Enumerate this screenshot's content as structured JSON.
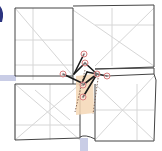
{
  "diagram": {
    "type": "origami-fold-diagram",
    "colors": {
      "background": "#ffffff",
      "outline": "#444444",
      "crease": "#d6d6d6",
      "axis_band": "#c9cde6",
      "highlight_fill": "#f5d7b5",
      "highlight_dash": "#6a4a3a",
      "vertex_marker": "#d98080",
      "fold_link": "#1a1a1a",
      "left_blob": "#2c3480"
    },
    "vertices": [
      {
        "id": "v1",
        "x": 84,
        "y": 54
      },
      {
        "id": "v2",
        "x": 85,
        "y": 63
      },
      {
        "id": "v3",
        "x": 63,
        "y": 74
      },
      {
        "id": "v4",
        "x": 97,
        "y": 74
      },
      {
        "id": "v5",
        "x": 107,
        "y": 76
      },
      {
        "id": "v6",
        "x": 83,
        "y": 85
      },
      {
        "id": "v7",
        "x": 83,
        "y": 97
      }
    ]
  }
}
